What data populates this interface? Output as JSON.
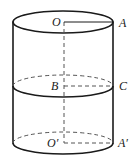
{
  "figure": {
    "kind": "solid-geometry-diagram",
    "shape": "cylinder",
    "canvas": {
      "width": 139,
      "height": 161,
      "background": "#ffffff"
    },
    "stroke": {
      "solid_color": "#1a1a1a",
      "dashed_color": "#555555",
      "outline_width": 1.6,
      "thin_width": 1.0,
      "dash_pattern": "4,3"
    },
    "geometry": {
      "center_x": 63,
      "left_wall_x": 13,
      "right_wall_x": 113,
      "radius_x": 50,
      "radius_y": 11,
      "top_center_y": 22,
      "middle_center_y": 86,
      "bottom_center_y": 143,
      "axis_x": 64
    },
    "labels": [
      {
        "id": "O",
        "text": "O",
        "x": 52,
        "y": 16,
        "name": "label-o"
      },
      {
        "id": "A",
        "text": "A",
        "x": 119,
        "y": 17,
        "name": "label-a"
      },
      {
        "id": "B",
        "text": "B",
        "x": 51,
        "y": 80,
        "name": "label-b"
      },
      {
        "id": "C",
        "text": "C",
        "x": 119,
        "y": 80,
        "name": "label-c"
      },
      {
        "id": "Op",
        "text": "O′",
        "x": 47,
        "y": 137,
        "name": "label-o-prime"
      },
      {
        "id": "Ap",
        "text": "A′",
        "x": 118,
        "y": 137,
        "name": "label-a-prime"
      }
    ],
    "segments": [
      {
        "id": "OA",
        "style": "solid",
        "from": "O",
        "to": "A",
        "note": "top radius"
      },
      {
        "id": "BC",
        "style": "dashed",
        "from": "B",
        "to": "C",
        "note": "middle radius"
      },
      {
        "id": "OpAp",
        "style": "dashed",
        "from": "O′",
        "to": "A′",
        "note": "bottom radius"
      },
      {
        "id": "OOp",
        "style": "dashed",
        "from": "O",
        "to": "O′",
        "note": "cylinder axis"
      }
    ]
  }
}
